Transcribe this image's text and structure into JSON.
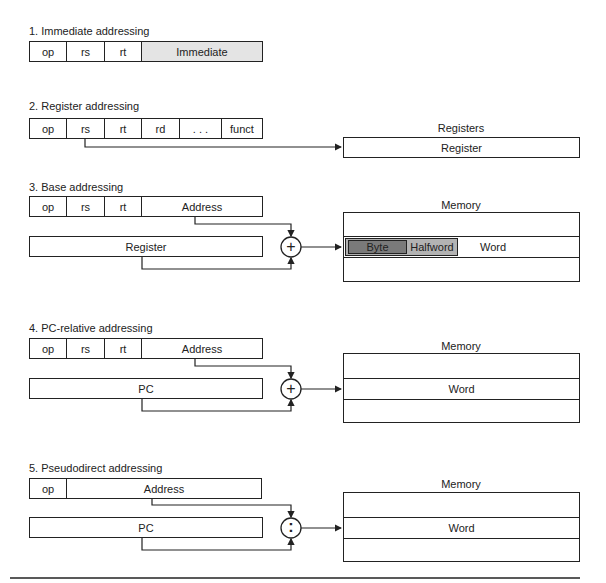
{
  "sections": [
    {
      "title": "1. Immediate addressing",
      "fields": [
        "op",
        "rs",
        "rt",
        "Immediate"
      ]
    },
    {
      "title": "2. Register addressing",
      "fields": [
        "op",
        "rs",
        "rt",
        "rd",
        ". . .",
        "funct"
      ],
      "target_label": "Registers",
      "target_row": "Register"
    },
    {
      "title": "3. Base addressing",
      "fields": [
        "op",
        "rs",
        "rt",
        "Address"
      ],
      "source_register": "Register",
      "operator": "+",
      "target_label": "Memory",
      "target_row": {
        "byte": "Byte",
        "halfword": "Halfword",
        "word": "Word"
      }
    },
    {
      "title": "4. PC-relative addressing",
      "fields": [
        "op",
        "rs",
        "rt",
        "Address"
      ],
      "source_register": "PC",
      "operator": "+",
      "target_label": "Memory",
      "target_row": "Word"
    },
    {
      "title": "5. Pseudodirect addressing",
      "fields": [
        "op",
        "Address"
      ],
      "source_register": "PC",
      "operator": ":",
      "target_label": "Memory",
      "target_row": "Word"
    }
  ],
  "colors": {
    "line": "#222222",
    "shade_light": "#e4e4e4",
    "byte_fill": "#7a7a7a",
    "halfword_fill": "#b3b3b3"
  }
}
